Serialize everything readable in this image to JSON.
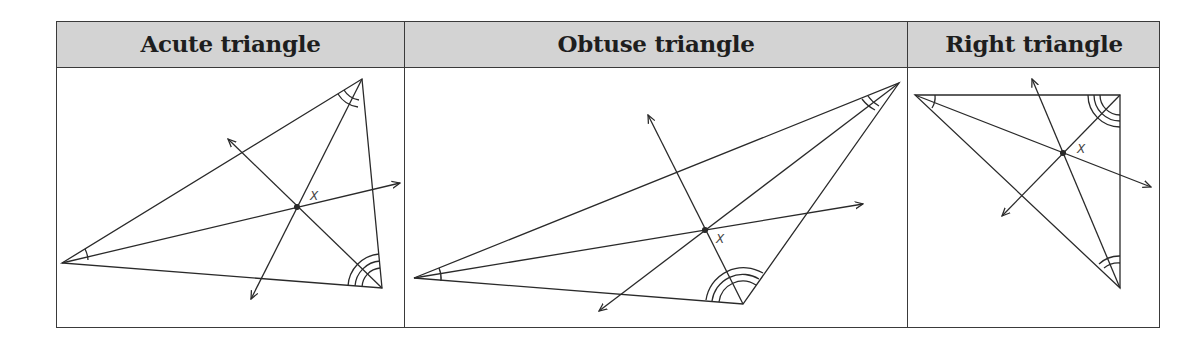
{
  "table": {
    "columns": [
      {
        "header": "Acute triangle"
      },
      {
        "header": "Obtuse triangle"
      },
      {
        "header": "Right triangle"
      }
    ]
  },
  "figures": [
    {
      "name": "acute",
      "vertices": {
        "A": [
          62,
          263
        ],
        "B": [
          362,
          79
        ],
        "C": [
          382,
          288
        ]
      },
      "incenter_label": "X",
      "incenter": [
        297,
        207
      ]
    },
    {
      "name": "obtuse",
      "vertices": {
        "A": [
          414,
          278
        ],
        "B": [
          899,
          83
        ],
        "C": [
          743,
          304
        ]
      },
      "incenter_label": "X",
      "incenter": [
        705,
        230
      ]
    },
    {
      "name": "right",
      "vertices": {
        "A": [
          915,
          95
        ],
        "B": [
          1120,
          95
        ],
        "C": [
          1120,
          288
        ]
      },
      "incenter_label": "X",
      "incenter": [
        1063,
        153
      ]
    }
  ],
  "colors": {
    "line": "#2a2a2a",
    "header_bg": "#d3d3d3",
    "border": "#3a3a3a"
  }
}
